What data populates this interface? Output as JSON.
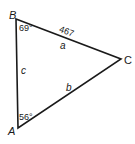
{
  "diagram": {
    "type": "triangle",
    "stroke_color": "#1a1a1a",
    "vertices": {
      "A": {
        "label": "A",
        "x": 18,
        "y": 128
      },
      "B": {
        "label": "B",
        "x": 16,
        "y": 19
      },
      "C": {
        "label": "C",
        "x": 121,
        "y": 59
      }
    },
    "sides": {
      "a": {
        "label": "a",
        "length": "467"
      },
      "b": {
        "label": "b"
      },
      "c": {
        "label": "c"
      }
    },
    "angles": {
      "B": "69°",
      "A": "56°"
    }
  }
}
